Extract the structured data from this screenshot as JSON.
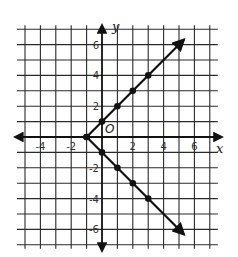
{
  "chart_data": {
    "type": "line",
    "title": "",
    "xlabel": "x",
    "ylabel": "y",
    "origin_label": "O",
    "xlim": [
      -5,
      7
    ],
    "ylim": [
      -7,
      7
    ],
    "grid": true,
    "x_ticks": [
      -4,
      -2,
      2,
      4,
      6
    ],
    "y_ticks": [
      6,
      4,
      2,
      -2,
      -4,
      -6
    ],
    "x_tick_labels": [
      "-4",
      "-2",
      "2",
      "4",
      "6"
    ],
    "y_tick_labels": [
      "6",
      "4",
      "2",
      "-2",
      "-4",
      "-6"
    ],
    "vertex": [
      -1,
      0
    ],
    "series": [
      {
        "name": "upper ray",
        "points": [
          [
            -1,
            0
          ],
          [
            0,
            1
          ],
          [
            1,
            2
          ],
          [
            2,
            3
          ],
          [
            3,
            4
          ]
        ],
        "arrow_end": [
          5.3,
          6.3
        ]
      },
      {
        "name": "lower ray",
        "points": [
          [
            -1,
            0
          ],
          [
            0,
            -1
          ],
          [
            1,
            -2
          ],
          [
            2,
            -3
          ],
          [
            3,
            -4
          ]
        ],
        "arrow_end": [
          5.3,
          -6.3
        ]
      }
    ],
    "colors": {
      "grid": "#2a2a2a",
      "lines": "#111111",
      "background": "#ffffff"
    }
  }
}
